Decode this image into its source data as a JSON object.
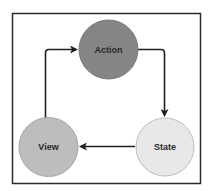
{
  "diagram": {
    "type": "cycle-flow",
    "nodes": [
      {
        "id": "action",
        "label": "Action",
        "fill": "#858585",
        "stroke": "#7a7a7a"
      },
      {
        "id": "state",
        "label": "State",
        "fill": "#e8e8e8",
        "stroke": "#bdbdbd"
      },
      {
        "id": "view",
        "label": "View",
        "fill": "#bdbdbd",
        "stroke": "#a5a5a5"
      }
    ],
    "edges": [
      {
        "from": "action",
        "to": "state"
      },
      {
        "from": "state",
        "to": "view"
      },
      {
        "from": "view",
        "to": "action"
      }
    ],
    "colors": {
      "frame": "#2b2b2b",
      "arrow": "#1e1e1e",
      "background": "#ffffff"
    }
  }
}
